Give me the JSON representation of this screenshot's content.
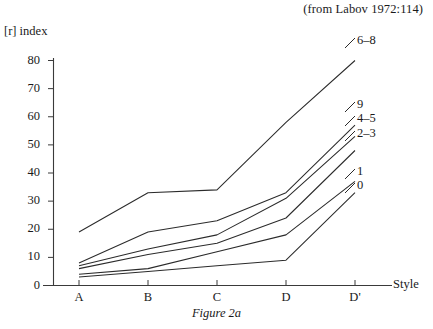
{
  "header": {
    "source_note": "(from Labov 1972:114)",
    "cut_top_text": " "
  },
  "caption": "Figure 2a",
  "chart_data": {
    "type": "line",
    "title": "",
    "subtitle": "",
    "annotation": "(from Labov 1972:114)",
    "caption": "Figure 2a",
    "xlabel": "Style",
    "ylabel": "[r] index",
    "categories": [
      "A",
      "B",
      "C",
      "D",
      "D'"
    ],
    "xticklabels": [
      "A",
      "B",
      "C",
      "D",
      "D'"
    ],
    "yticklabels": [
      "0",
      "10",
      "20",
      "30",
      "40",
      "50",
      "60",
      "70",
      "80"
    ],
    "yticks": [
      0,
      10,
      20,
      30,
      40,
      50,
      60,
      70,
      80
    ],
    "ylim": [
      0,
      80
    ],
    "grid": false,
    "legend": "right-of-line-ends",
    "series": [
      {
        "name": "6–8",
        "label": "6–8",
        "values": [
          19,
          33,
          34,
          58,
          80
        ]
      },
      {
        "name": "9",
        "label": "9",
        "values": [
          8,
          19,
          23,
          33,
          57
        ]
      },
      {
        "name": "4–5",
        "label": "4–5",
        "values": [
          7,
          13,
          18,
          31,
          53
        ]
      },
      {
        "name": "2–3",
        "label": "2–3",
        "values": [
          6,
          11,
          15,
          24,
          48
        ]
      },
      {
        "name": "1",
        "label": "1",
        "values": [
          4,
          6,
          12,
          18,
          37
        ]
      },
      {
        "name": "0",
        "label": "0",
        "values": [
          3,
          5,
          7,
          9,
          33
        ]
      }
    ]
  },
  "series_label_positions": [
    {
      "label": "6–8",
      "x": 357,
      "y": 41
    },
    {
      "label": "9",
      "x": 357,
      "y": 105
    },
    {
      "label": "4–5",
      "x": 357,
      "y": 119
    },
    {
      "label": "2–3",
      "x": 357,
      "y": 134
    },
    {
      "label": "1",
      "x": 357,
      "y": 172
    },
    {
      "label": "0",
      "x": 357,
      "y": 186
    }
  ],
  "colors": {
    "line": "#2b2b2b",
    "axis": "#3a3a3a",
    "text": "#1a1a1a",
    "background": "#ffffff"
  }
}
